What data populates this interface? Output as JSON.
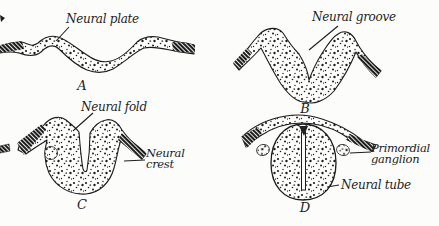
{
  "figure": {
    "colors": {
      "paper": "#fcfcfb",
      "ink": "#1d1d1d"
    }
  },
  "panels": {
    "a": {
      "letter": "A",
      "label": "Neural plate"
    },
    "b": {
      "letter": "B",
      "label": "Neural groove"
    },
    "c": {
      "letter": "C",
      "fold_label": "Neural fold",
      "crest_label_line1": "Neural",
      "crest_label_line2": "crest"
    },
    "d": {
      "letter": "D",
      "ganglion_label_line1": "Primordial",
      "ganglion_label_line2": "ganglion",
      "tube_label": "Neural tube"
    }
  }
}
